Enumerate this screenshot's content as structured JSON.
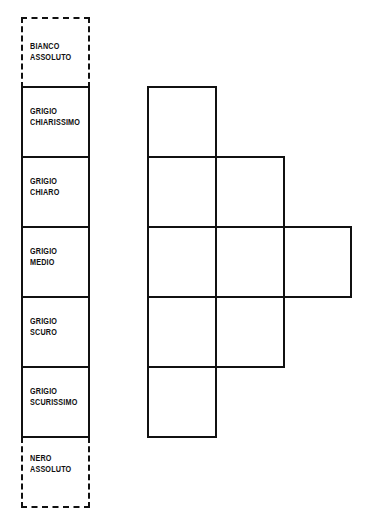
{
  "scale": {
    "items": [
      {
        "line1": "BIANCO",
        "line2": "ASSOLUTO",
        "style": "dashed"
      },
      {
        "line1": "GRIGIO",
        "line2": "CHIARISSIMO",
        "style": "solid"
      },
      {
        "line1": "GRIGIO",
        "line2": "CHIARO",
        "style": "solid"
      },
      {
        "line1": "GRIGIO",
        "line2": "MEDIO",
        "style": "solid"
      },
      {
        "line1": "GRIGIO",
        "line2": "SCURO",
        "style": "solid"
      },
      {
        "line1": "GRIGIO",
        "line2": "SCURISSIMO",
        "style": "solid"
      },
      {
        "line1": "NERO",
        "line2": "ASSOLUTO",
        "style": "dashed"
      }
    ]
  },
  "grid": {
    "rows": [
      1,
      2,
      3,
      2,
      1
    ]
  }
}
